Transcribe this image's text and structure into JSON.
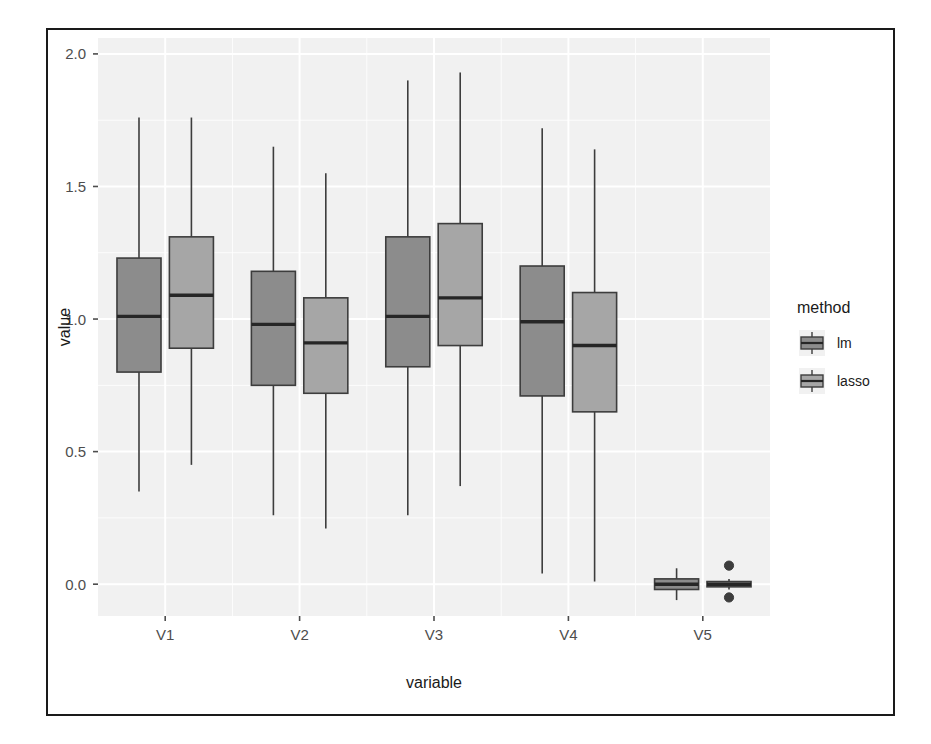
{
  "figure": {
    "background_color": "#ffffff",
    "frame_color": "#1a1a1a",
    "panel_background": "#f1f1f1",
    "grid_color": "#ffffff"
  },
  "axes": {
    "x": {
      "label": "variable",
      "tick_labels": [
        "V1",
        "V2",
        "V3",
        "V4",
        "V5"
      ]
    },
    "y": {
      "label": "value",
      "tick_labels": [
        "0.0",
        "0.5",
        "1.0",
        "1.5",
        "2.0"
      ],
      "tick_values": [
        0.0,
        0.5,
        1.0,
        1.5,
        2.0
      ]
    }
  },
  "legend": {
    "title": "method",
    "items": [
      {
        "label": "lm",
        "color": "#8c8c8c"
      },
      {
        "label": "lasso",
        "color": "#a6a6a6"
      }
    ]
  },
  "chart_data": {
    "type": "box",
    "title": "",
    "xlabel": "variable",
    "ylabel": "value",
    "ylim": [
      -0.12,
      2.06
    ],
    "grid": true,
    "legend_position": "right",
    "legend_title": "method",
    "categories": [
      "V1",
      "V2",
      "V3",
      "V4",
      "V5"
    ],
    "series": [
      {
        "name": "lm",
        "color": "#8c8c8c",
        "boxes": [
          {
            "category": "V1",
            "whisker_low": 0.35,
            "q1": 0.8,
            "median": 1.01,
            "q3": 1.23,
            "whisker_high": 1.76,
            "outliers": []
          },
          {
            "category": "V2",
            "whisker_low": 0.26,
            "q1": 0.75,
            "median": 0.98,
            "q3": 1.18,
            "whisker_high": 1.65,
            "outliers": []
          },
          {
            "category": "V3",
            "whisker_low": 0.26,
            "q1": 0.82,
            "median": 1.01,
            "q3": 1.31,
            "whisker_high": 1.9,
            "outliers": []
          },
          {
            "category": "V4",
            "whisker_low": 0.04,
            "q1": 0.71,
            "median": 0.99,
            "q3": 1.2,
            "whisker_high": 1.72,
            "outliers": []
          },
          {
            "category": "V5",
            "whisker_low": -0.06,
            "q1": -0.02,
            "median": 0.0,
            "q3": 0.02,
            "whisker_high": 0.06,
            "outliers": []
          }
        ]
      },
      {
        "name": "lasso",
        "color": "#a6a6a6",
        "boxes": [
          {
            "category": "V1",
            "whisker_low": 0.45,
            "q1": 0.89,
            "median": 1.09,
            "q3": 1.31,
            "whisker_high": 1.76,
            "outliers": []
          },
          {
            "category": "V2",
            "whisker_low": 0.21,
            "q1": 0.72,
            "median": 0.91,
            "q3": 1.08,
            "whisker_high": 1.55,
            "outliers": []
          },
          {
            "category": "V3",
            "whisker_low": 0.37,
            "q1": 0.9,
            "median": 1.08,
            "q3": 1.36,
            "whisker_high": 1.93,
            "outliers": []
          },
          {
            "category": "V4",
            "whisker_low": 0.01,
            "q1": 0.65,
            "median": 0.9,
            "q3": 1.1,
            "whisker_high": 1.64,
            "outliers": []
          },
          {
            "category": "V5",
            "whisker_low": -0.02,
            "q1": -0.01,
            "median": 0.0,
            "q3": 0.01,
            "whisker_high": 0.02,
            "outliers": [
              0.07,
              -0.05
            ]
          }
        ]
      }
    ]
  }
}
